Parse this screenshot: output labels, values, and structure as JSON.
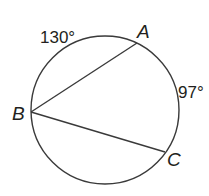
{
  "diagram": {
    "type": "circle-with-inscribed-angle",
    "stroke_color": "#3a3a3a",
    "circle": {
      "cx": 105,
      "cy": 110,
      "r": 74
    },
    "points": {
      "A": {
        "label": "A",
        "x": 137,
        "y": 43
      },
      "B": {
        "label": "B",
        "x": 31,
        "y": 112
      },
      "C": {
        "label": "C",
        "x": 165,
        "y": 152
      }
    },
    "chords": [
      {
        "from": "B",
        "to": "A"
      },
      {
        "from": "B",
        "to": "C"
      }
    ],
    "arcs": {
      "arc_AB": {
        "label": "130°",
        "between": [
          "A",
          "B"
        ]
      },
      "arc_AC": {
        "label": "97°",
        "between": [
          "A",
          "C"
        ]
      }
    }
  }
}
